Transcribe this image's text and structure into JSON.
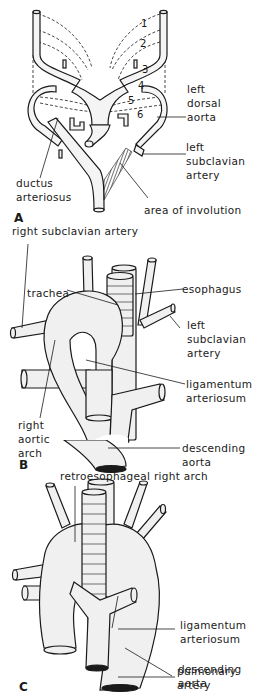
{
  "figure": {
    "background": "#ffffff",
    "ink": "#1a1a1a",
    "panels": [
      {
        "letter": "A",
        "arch_numbers": [
          "1",
          "2",
          "3",
          "4",
          "5",
          "6"
        ],
        "labels": {
          "left_dorsal_aorta": [
            "left",
            "dorsal",
            "aorta"
          ],
          "left_subclavian_artery": [
            "left",
            "subclavian",
            "artery"
          ],
          "ductus_arteriosus": [
            "ductus",
            "arteriosus"
          ],
          "area_of_involution": "area of involution"
        }
      },
      {
        "letter": "B",
        "labels": {
          "right_subclavian_artery": "right subclavian artery",
          "trachea": "trachea",
          "esophagus": "esophagus",
          "left_subclavian_artery": [
            "left",
            "subclavian",
            "artery"
          ],
          "ligamentum_arteriosum": [
            "ligamentum",
            "arteriosum"
          ],
          "right_aortic_arch": [
            "right",
            "aortic",
            "arch"
          ],
          "descending_aorta": [
            "descending",
            "aorta"
          ]
        }
      },
      {
        "letter": "C",
        "labels": {
          "retroesophageal_right_arch": "retroesophageal right arch",
          "ligamentum_arteriosum": [
            "ligamentum",
            "arteriosum"
          ],
          "pulmonary_artery": [
            "pulmonary",
            "artery"
          ],
          "descending_aorta": [
            "descending",
            "aorta"
          ]
        }
      }
    ]
  }
}
